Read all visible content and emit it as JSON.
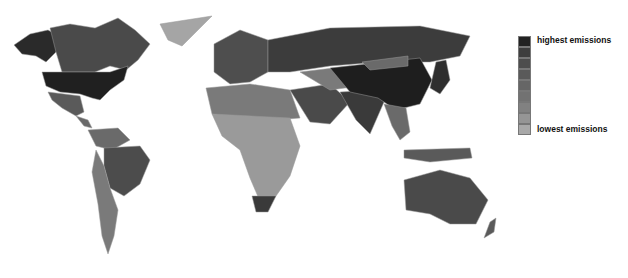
{
  "legend": {
    "top_label": "highest emissions",
    "bottom_label": "lowest emissions",
    "swatches": [
      "#222222",
      "#3e3e3e",
      "#4d4d4d",
      "#5a5a5a",
      "#666666",
      "#727272",
      "#818181",
      "#959595",
      "#a8a8a8"
    ]
  },
  "colors": {
    "background": "#ffffff",
    "border": "#9a9a9a"
  }
}
